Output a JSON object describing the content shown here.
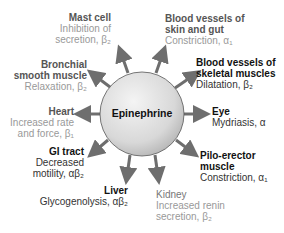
{
  "center": {
    "label": "Epinephrine"
  },
  "colors": {
    "dark": "#1a1a1a",
    "gray": "#8a8a8a",
    "arrow": "#6e6e6e",
    "circle_light": "#f2f2f2",
    "circle_dark": "#b8b8b8"
  },
  "targets": [
    {
      "id": "mast-cell",
      "title": [
        "Mast cell"
      ],
      "effect": [
        "Inhibition of",
        "secretion, β₂"
      ],
      "tone": "gray"
    },
    {
      "id": "bv-skin-gut",
      "title": [
        "Blood vessels of",
        "skin and gut"
      ],
      "effect": [
        "Constriction, α₁"
      ],
      "tone": "gray"
    },
    {
      "id": "bronchial",
      "title": [
        "Bronchial",
        "smooth muscle"
      ],
      "effect": [
        "Relaxation, β₂"
      ],
      "tone": "gray"
    },
    {
      "id": "bv-skeletal",
      "title": [
        "Blood vessels of",
        "skeletal muscles"
      ],
      "effect": [
        "Dilatation, β₂"
      ],
      "tone": "dark"
    },
    {
      "id": "heart",
      "title": [
        "Heart"
      ],
      "effect": [
        "Increased rate",
        "and force, β₁"
      ],
      "tone": "gray"
    },
    {
      "id": "eye",
      "title": [
        "Eye"
      ],
      "effect": [
        "Mydriasis, α"
      ],
      "tone": "dark"
    },
    {
      "id": "gi-tract",
      "title": [
        "GI tract"
      ],
      "effect": [
        "Decreased",
        "motility, αβ₂"
      ],
      "tone": "dark"
    },
    {
      "id": "pilo-erector",
      "title": [
        "Pilo-erector",
        "muscle"
      ],
      "effect": [
        "Constriction, α₁"
      ],
      "tone": "dark"
    },
    {
      "id": "liver",
      "title": [
        "Liver"
      ],
      "effect": [
        "Glycogenolysis, αβ₂"
      ],
      "tone": "dark"
    },
    {
      "id": "kidney",
      "title": [
        "Kidney"
      ],
      "effect": [
        "Increased renin",
        "secretion, β₂"
      ],
      "tone": "gray"
    }
  ]
}
